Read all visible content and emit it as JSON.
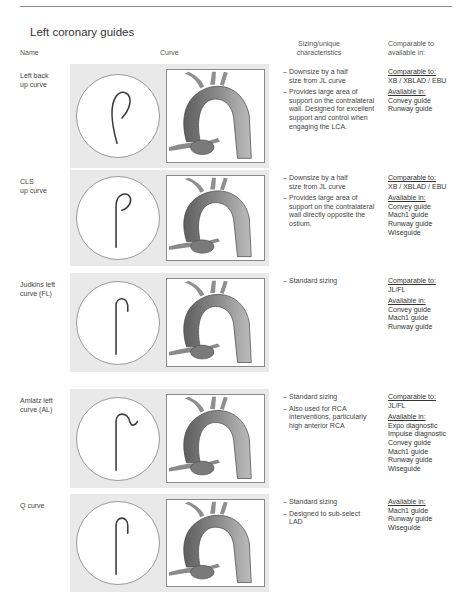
{
  "section_title": "Left coronary guides",
  "columns": {
    "name": "Name",
    "curve": "Curve",
    "sizing_line1": "Sizing/unique",
    "sizing_line2": "characteristics",
    "comparable_line1": "Comparable to",
    "comparable_line2": "available in:"
  },
  "labels": {
    "comparable": "Comparable to:",
    "available": "Available in:"
  },
  "rows": [
    {
      "name_line1": "Left back",
      "name_line2": "up curve",
      "characteristics": [
        [
          "Downsize by a half",
          "size from JL curve"
        ],
        [
          "Provides large area of",
          "support on the contralateral",
          "wall. Designed for excellent",
          "support and control when",
          "engaging the LCA."
        ]
      ],
      "comparable_to": "XB / XBLAD / EBU",
      "available_in": [
        "Convey guide",
        "Runway guide"
      ]
    },
    {
      "name_line1": "CLS",
      "name_line2": "up curve",
      "characteristics": [
        [
          "Downsize by a half",
          "size from JL curve"
        ],
        [
          "Provides large area of",
          "support on the contralateral",
          "wall directly opposite the",
          "ostium."
        ]
      ],
      "comparable_to": "XB / XBLAD / EBU",
      "available_in": [
        "Convey guide",
        "Mach1 guide",
        "Runway guide",
        "Wiseguide"
      ]
    },
    {
      "name_line1": "Judkins left",
      "name_line2": "curve (FL)",
      "characteristics": [
        [
          "Standard sizing"
        ]
      ],
      "comparable_to": "JL/FL",
      "available_in": [
        "Convey guide",
        "Mach1 guide",
        "Runway guide"
      ]
    },
    {
      "name_line1": "Amlatz left",
      "name_line2": "curve (AL)",
      "characteristics": [
        [
          "Standard sizing"
        ],
        [
          "Also used for RCA",
          "interventions, particularly",
          "high anterior RCA"
        ]
      ],
      "comparable_to": "JL/FL",
      "available_in": [
        "Expo diagnostic",
        "Impulse diagnostic",
        "Convey guide",
        "Mach1 guide",
        "Runway guide",
        "Wiseguide"
      ]
    },
    {
      "name_line1": "Q curve",
      "name_line2": "",
      "characteristics": [
        [
          "Standard sizing"
        ],
        [
          "Designed to sub-select",
          "LAD"
        ]
      ],
      "comparable_to": null,
      "available_in": [
        "Mach1 guide",
        "Runway guide",
        "Wiseguide"
      ]
    }
  ]
}
